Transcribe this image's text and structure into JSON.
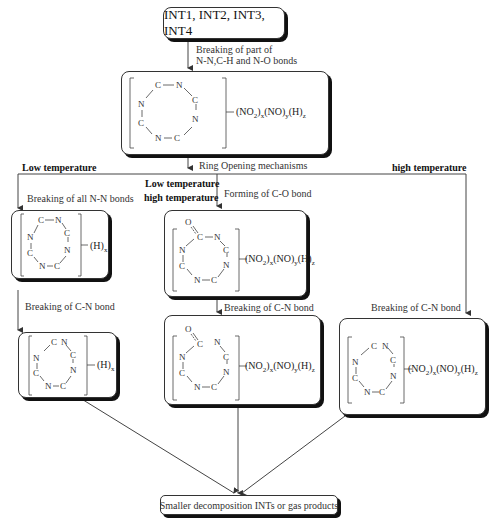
{
  "diagram": {
    "top_node": {
      "label": "INT1, INT2, INT3, INT4"
    },
    "step1_label_line1": "Breaking of part of",
    "step1_label_line2": "N-N,C-H and N-O bonds",
    "ring_node": {
      "ring_atoms": [
        "C",
        "N",
        "C",
        "N",
        "C",
        "N",
        "C",
        "N"
      ],
      "substituent_prefix": "(NO",
      "substituent_formula": "(NO2)x(NO)y(H)z"
    },
    "ring_opening_label": "Ring Opening mechanisms",
    "branches": {
      "left": {
        "condition": "Low temperature",
        "step1": "Breaking of all N-N bonds",
        "node1_substituent": "(H)x",
        "step2": "Breaking of C-N bond",
        "node2_substituent": "(H)x"
      },
      "middle": {
        "condition_line1": "Low temperature",
        "condition_line2": "high temperature",
        "step1": "Forming of C-O bond",
        "node1_substituent": "(NO2)x(NO)y(H)z",
        "step2": "Breaking of C-N bond",
        "node2_substituent": "(NO2)x(NO)y(H)z"
      },
      "right": {
        "condition": "high temperature",
        "step1": "Breaking of C-N bond",
        "node1_substituent": "(NO2)x(NO)y(H)z"
      }
    },
    "final_node": {
      "label": "Smaller decomposition INTs or gas products"
    }
  },
  "atoms": {
    "C": "C",
    "N": "N",
    "O": "O"
  },
  "sub": {
    "two": "2",
    "x": "x",
    "y": "y",
    "z": "z"
  },
  "formula_parts": {
    "no2_open": "(NO",
    "no2_close": ")",
    "no_open": "(NO)",
    "h_open": "(H)"
  }
}
